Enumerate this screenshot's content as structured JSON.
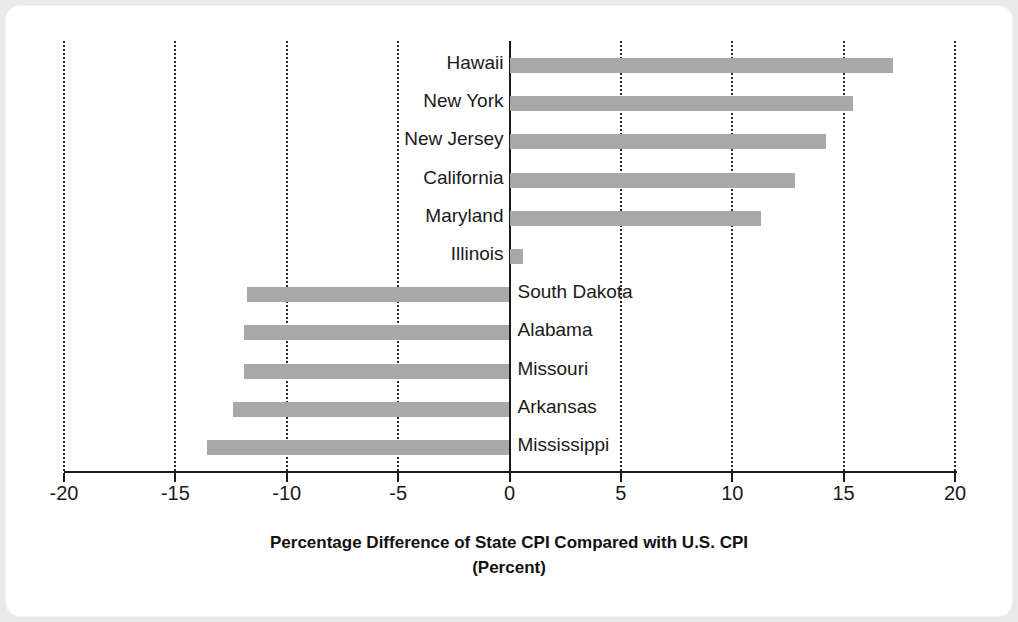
{
  "chart_data": {
    "type": "bar",
    "orientation": "horizontal",
    "title": "",
    "xlabel": "Percentage Difference of State CPI Compared with U.S. CPI",
    "xlabel_line2": "(Percent)",
    "ylabel": "",
    "xlim": [
      -20,
      20
    ],
    "xticks": [
      -20,
      -15,
      -10,
      -5,
      0,
      5,
      10,
      15,
      20
    ],
    "xticklabels": [
      "-20",
      "-15",
      "-10",
      "-5",
      "0",
      "5",
      "10",
      "15",
      "20"
    ],
    "grid": "vertical-dotted",
    "legend": "none",
    "bar_color": "#a8a8a8",
    "categories": [
      "Hawaii",
      "New York",
      "New Jersey",
      "California",
      "Maryland",
      "Illinois",
      "South Dakota",
      "Alabama",
      "Missouri",
      "Arkansas",
      "Mississippi"
    ],
    "values": [
      17.2,
      15.4,
      14.2,
      12.8,
      11.3,
      0.6,
      -11.8,
      -11.9,
      -11.9,
      -12.4,
      -13.6
    ]
  }
}
